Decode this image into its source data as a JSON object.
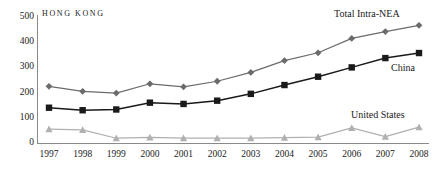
{
  "chart_data": {
    "type": "line",
    "title": "HONG KONG",
    "xlabel": "",
    "ylabel": "",
    "categories": [
      "1997",
      "1998",
      "1999",
      "2000",
      "2001",
      "2002",
      "2003",
      "2004",
      "2005",
      "2006",
      "2007",
      "2008"
    ],
    "x": [
      1997,
      1998,
      1999,
      2000,
      2001,
      2002,
      2003,
      2004,
      2005,
      2006,
      2007,
      2008
    ],
    "ylim": [
      0,
      500
    ],
    "yticks": [
      0,
      100,
      200,
      300,
      400,
      500
    ],
    "ytick_labels": [
      "0",
      "100",
      "200",
      "300",
      "400",
      "500"
    ],
    "grid": false,
    "legend_position": "inline-right-annotations",
    "series": [
      {
        "name": "Total Intra-NEA",
        "marker": "diamond",
        "color": "#6b6b6b",
        "values": [
          225,
          205,
          198,
          235,
          223,
          245,
          280,
          327,
          358,
          415,
          442,
          467
        ]
      },
      {
        "name": "China",
        "marker": "square",
        "color": "#1a1a1a",
        "values": [
          140,
          130,
          133,
          160,
          155,
          168,
          195,
          230,
          263,
          300,
          337,
          357
        ]
      },
      {
        "name": "United States",
        "marker": "triangle",
        "color": "#b0b0b0",
        "values": [
          55,
          52,
          19,
          22,
          19,
          19,
          19,
          21,
          23,
          60,
          25,
          63
        ]
      }
    ],
    "annotations": [
      {
        "text": "Total Intra-NEA",
        "series": "Total Intra-NEA"
      },
      {
        "text": "China",
        "series": "China"
      },
      {
        "text": "United States",
        "series": "United States"
      }
    ]
  },
  "axis_colors": {
    "axis_line": "#8a8a8a",
    "text": "#1a1a1a"
  }
}
